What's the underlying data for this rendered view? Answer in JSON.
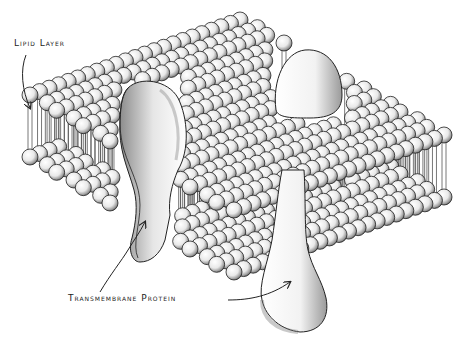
{
  "diagram": {
    "type": "cell-membrane-illustration",
    "style": "black-and-white stipple drawing",
    "labels": {
      "lipid_layer": "Lipid Layer",
      "transmembrane_protein": "Transmembrane Protein"
    },
    "components": [
      {
        "name": "phospholipid bilayer",
        "label": "Lipid Layer"
      },
      {
        "name": "transmembrane protein (left, channel-shaped)",
        "label": "Transmembrane Protein"
      },
      {
        "name": "transmembrane protein (right, rounded top, bulb bottom)",
        "label": "Transmembrane Protein"
      }
    ],
    "colors": {
      "ink": "#1a1a1a",
      "background": "#ffffff",
      "sphere_fill": "#f4f4f4",
      "shade": "#8a8a8a"
    }
  }
}
